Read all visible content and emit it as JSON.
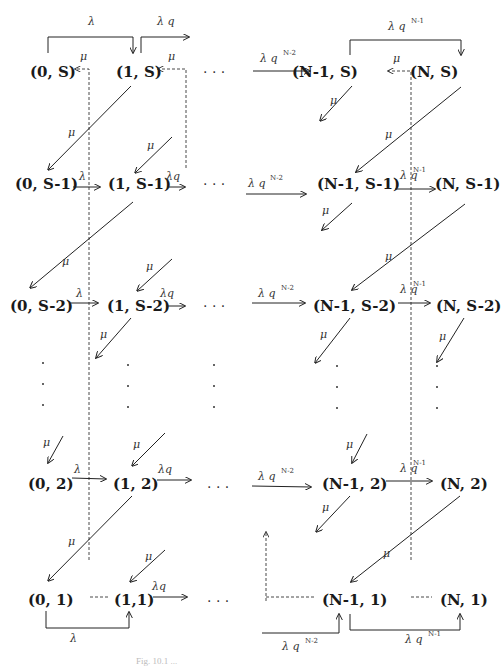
{
  "diagram": {
    "nodes": [
      {
        "id": "n0S",
        "label": "(0, S)",
        "x": 40,
        "y": 72
      },
      {
        "id": "n1S",
        "label": "(1, S)",
        "x": 127,
        "y": 72
      },
      {
        "id": "nN1S",
        "label": "(N-1, S)",
        "x": 295,
        "y": 72
      },
      {
        "id": "nNS",
        "label": "(N, S)",
        "x": 428,
        "y": 72
      },
      {
        "id": "n0S1",
        "label": "(0, S-1)",
        "x": 38,
        "y": 183
      },
      {
        "id": "n1S1",
        "label": "(1, S-1)",
        "x": 132,
        "y": 183
      },
      {
        "id": "nN1S1",
        "label": "(N-1, S-1)",
        "x": 292,
        "y": 183
      },
      {
        "id": "nNS1",
        "label": "(N, S-1)",
        "x": 432,
        "y": 183
      },
      {
        "id": "n0S2",
        "label": "(0, S-2)",
        "x": 35,
        "y": 307
      },
      {
        "id": "n1S2",
        "label": "(1, S-2)",
        "x": 130,
        "y": 307
      },
      {
        "id": "nN1S2",
        "label": "(N-1, S-2)",
        "x": 290,
        "y": 307
      },
      {
        "id": "nNS2",
        "label": "(N, S-2)",
        "x": 430,
        "y": 307
      },
      {
        "id": "n02",
        "label": "(0, 2)",
        "x": 45,
        "y": 487
      },
      {
        "id": "n12",
        "label": "(1, 2)",
        "x": 132,
        "y": 487
      },
      {
        "id": "nN12",
        "label": "(N-1, 2)",
        "x": 300,
        "y": 487
      },
      {
        "id": "nN2",
        "label": "(N, 2)",
        "x": 440,
        "y": 487
      },
      {
        "id": "n01",
        "label": "(0, 1)",
        "x": 45,
        "y": 601
      },
      {
        "id": "n11",
        "label": "(1,1)",
        "x": 134,
        "y": 601
      },
      {
        "id": "nN11",
        "label": "(N-1, 1)",
        "x": 322,
        "y": 601
      },
      {
        "id": "nN1",
        "label": "(N, 1)",
        "x": 440,
        "y": 601
      }
    ],
    "ellipsis": "· · ·",
    "vdots": "·",
    "labels": {
      "lambda": "λ",
      "lambda_q": "λ q",
      "lambda_q_compact": "λq",
      "mu": "μ",
      "lambda_q_sym": "λ q",
      "exp_N2": "N-2",
      "exp_N1": "N-1"
    },
    "caption": "Fig. 10.1 ..."
  }
}
